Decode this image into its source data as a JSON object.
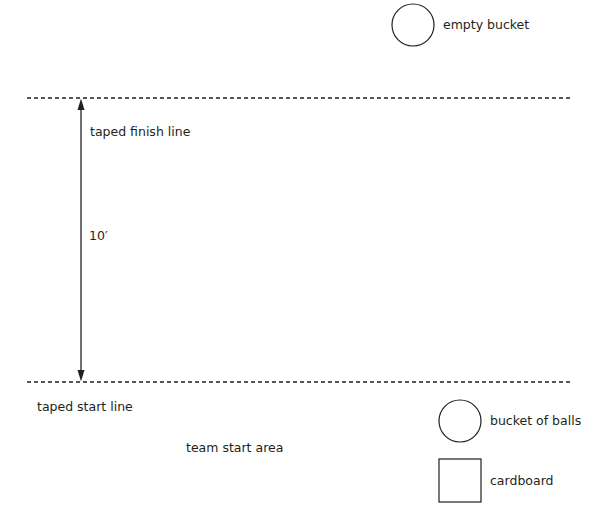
{
  "diagram": {
    "type": "relay-course-layout",
    "colors": {
      "line": "#231f20",
      "background": "#ffffff"
    },
    "lines": {
      "finish": {
        "label": "taped finish line",
        "style": "dashed"
      },
      "start": {
        "label": "taped start line",
        "style": "dashed"
      }
    },
    "distance": {
      "label": "10′",
      "arrow": "double-headed vertical"
    },
    "objects": [
      {
        "shape": "circle",
        "label": "empty bucket"
      },
      {
        "shape": "circle",
        "label": "bucket of balls"
      },
      {
        "shape": "square",
        "label": "cardboard"
      }
    ],
    "areas": [
      {
        "label": "team start area"
      }
    ]
  }
}
